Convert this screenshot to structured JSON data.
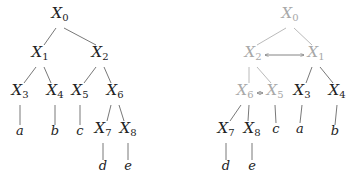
{
  "colors": {
    "active": "#222222",
    "faded": "#a8a8a8",
    "edge": "#555555"
  },
  "left_tree": {
    "nodes": [
      {
        "id": "X0",
        "base": "X",
        "sub": "0",
        "x": 60,
        "y": 18,
        "faded": false
      },
      {
        "id": "X1",
        "base": "X",
        "sub": "1",
        "x": 40,
        "y": 57,
        "faded": false
      },
      {
        "id": "X2",
        "base": "X",
        "sub": "2",
        "x": 100,
        "y": 57,
        "faded": false
      },
      {
        "id": "X3",
        "base": "X",
        "sub": "3",
        "x": 20,
        "y": 95,
        "faded": false
      },
      {
        "id": "X4",
        "base": "X",
        "sub": "4",
        "x": 55,
        "y": 95,
        "faded": false
      },
      {
        "id": "X5",
        "base": "X",
        "sub": "5",
        "x": 80,
        "y": 95,
        "faded": false
      },
      {
        "id": "X6",
        "base": "X",
        "sub": "6",
        "x": 115,
        "y": 95,
        "faded": false
      },
      {
        "id": "a",
        "base": "a",
        "sub": "",
        "x": 20,
        "y": 135,
        "faded": false
      },
      {
        "id": "b",
        "base": "b",
        "sub": "",
        "x": 55,
        "y": 135,
        "faded": false
      },
      {
        "id": "c",
        "base": "c",
        "sub": "",
        "x": 80,
        "y": 135,
        "faded": false
      },
      {
        "id": "X7",
        "base": "X",
        "sub": "7",
        "x": 103,
        "y": 133,
        "faded": false
      },
      {
        "id": "X8",
        "base": "X",
        "sub": "8",
        "x": 128,
        "y": 133,
        "faded": false
      },
      {
        "id": "d",
        "base": "d",
        "sub": "",
        "x": 103,
        "y": 170,
        "faded": false
      },
      {
        "id": "e",
        "base": "e",
        "sub": "",
        "x": 128,
        "y": 170,
        "faded": false
      }
    ],
    "edges": [
      [
        "X0",
        "X1"
      ],
      [
        "X0",
        "X2"
      ],
      [
        "X1",
        "X3"
      ],
      [
        "X1",
        "X4"
      ],
      [
        "X2",
        "X5"
      ],
      [
        "X2",
        "X6"
      ],
      [
        "X3",
        "a"
      ],
      [
        "X4",
        "b"
      ],
      [
        "X5",
        "c"
      ],
      [
        "X6",
        "X7"
      ],
      [
        "X6",
        "X8"
      ],
      [
        "X7",
        "d"
      ],
      [
        "X8",
        "e"
      ]
    ]
  },
  "right_tree": {
    "nodes": [
      {
        "id": "X0",
        "base": "X",
        "sub": "0",
        "x": 290,
        "y": 18,
        "faded": true
      },
      {
        "id": "X2",
        "base": "X",
        "sub": "2",
        "x": 253,
        "y": 57,
        "faded": true
      },
      {
        "id": "X1",
        "base": "X",
        "sub": "1",
        "x": 316,
        "y": 57,
        "faded": true
      },
      {
        "id": "X6",
        "base": "X",
        "sub": "6",
        "x": 245,
        "y": 95,
        "faded": true
      },
      {
        "id": "X5",
        "base": "X",
        "sub": "5",
        "x": 275,
        "y": 95,
        "faded": true
      },
      {
        "id": "X3",
        "base": "X",
        "sub": "3",
        "x": 302,
        "y": 95,
        "faded": false
      },
      {
        "id": "X4",
        "base": "X",
        "sub": "4",
        "x": 337,
        "y": 95,
        "faded": false
      },
      {
        "id": "X7",
        "base": "X",
        "sub": "7",
        "x": 226,
        "y": 133,
        "faded": false
      },
      {
        "id": "X8",
        "base": "X",
        "sub": "8",
        "x": 252,
        "y": 133,
        "faded": false
      },
      {
        "id": "c",
        "base": "c",
        "sub": "",
        "x": 276,
        "y": 133,
        "faded": false
      },
      {
        "id": "a",
        "base": "a",
        "sub": "",
        "x": 300,
        "y": 133,
        "faded": false
      },
      {
        "id": "b",
        "base": "b",
        "sub": "",
        "x": 335,
        "y": 135,
        "faded": false
      },
      {
        "id": "d",
        "base": "d",
        "sub": "",
        "x": 226,
        "y": 170,
        "faded": false
      },
      {
        "id": "e",
        "base": "e",
        "sub": "",
        "x": 252,
        "y": 170,
        "faded": false
      }
    ],
    "edges": [
      [
        "X0",
        "X2"
      ],
      [
        "X0",
        "X1"
      ],
      [
        "X2",
        "X6"
      ],
      [
        "X2",
        "X5"
      ],
      [
        "X1",
        "X3"
      ],
      [
        "X1",
        "X4"
      ],
      [
        "X6",
        "X7"
      ],
      [
        "X6",
        "X8"
      ],
      [
        "X5",
        "c"
      ],
      [
        "X3",
        "a"
      ],
      [
        "X4",
        "b"
      ],
      [
        "X7",
        "d"
      ],
      [
        "X8",
        "e"
      ]
    ],
    "swaps": [
      [
        "X2",
        "X1"
      ],
      [
        "X6",
        "X5"
      ]
    ]
  }
}
